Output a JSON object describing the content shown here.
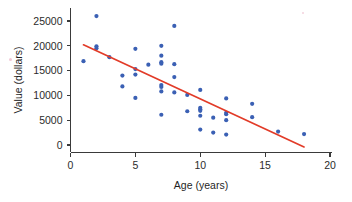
{
  "chart_data": {
    "type": "scatter",
    "title": "",
    "xlabel": "Age (years)",
    "ylabel": "Value (dollars)",
    "xlim": [
      0,
      20
    ],
    "ylim": [
      0,
      27000
    ],
    "xticks": [
      0,
      5,
      10,
      15,
      20
    ],
    "yticks": [
      0,
      5000,
      10000,
      15000,
      20000,
      25000
    ],
    "xtick_labels": [
      "0",
      "5",
      "10",
      "15",
      "20"
    ],
    "ytick_labels": [
      "0",
      "5000",
      "10000",
      "15000",
      "20000",
      "25000"
    ],
    "grid": false,
    "legend": false,
    "point_color": "#3b60b4",
    "line_color": "#e23b28",
    "points": [
      {
        "x": 1,
        "y": 16900
      },
      {
        "x": 2,
        "y": 26000
      },
      {
        "x": 2,
        "y": 19900
      },
      {
        "x": 2,
        "y": 19500
      },
      {
        "x": 3,
        "y": 17700
      },
      {
        "x": 4,
        "y": 14000
      },
      {
        "x": 4,
        "y": 11800
      },
      {
        "x": 5,
        "y": 19400
      },
      {
        "x": 5,
        "y": 15300
      },
      {
        "x": 5,
        "y": 14200
      },
      {
        "x": 5,
        "y": 9500
      },
      {
        "x": 6,
        "y": 16200
      },
      {
        "x": 7,
        "y": 20000
      },
      {
        "x": 7,
        "y": 18000
      },
      {
        "x": 7,
        "y": 16700
      },
      {
        "x": 7,
        "y": 16400
      },
      {
        "x": 7,
        "y": 12100
      },
      {
        "x": 7,
        "y": 11700
      },
      {
        "x": 7,
        "y": 10800
      },
      {
        "x": 7,
        "y": 6100
      },
      {
        "x": 8,
        "y": 24000
      },
      {
        "x": 8,
        "y": 16300
      },
      {
        "x": 8,
        "y": 13700
      },
      {
        "x": 8,
        "y": 10600
      },
      {
        "x": 9,
        "y": 10100
      },
      {
        "x": 9,
        "y": 6800
      },
      {
        "x": 10,
        "y": 11100
      },
      {
        "x": 10,
        "y": 7500
      },
      {
        "x": 10,
        "y": 7200
      },
      {
        "x": 10,
        "y": 6900
      },
      {
        "x": 10,
        "y": 5900
      },
      {
        "x": 10,
        "y": 3100
      },
      {
        "x": 11,
        "y": 5500
      },
      {
        "x": 11,
        "y": 2500
      },
      {
        "x": 12,
        "y": 9400
      },
      {
        "x": 12,
        "y": 6500
      },
      {
        "x": 12,
        "y": 6200
      },
      {
        "x": 12,
        "y": 5000
      },
      {
        "x": 12,
        "y": 2100
      },
      {
        "x": 14,
        "y": 8300
      },
      {
        "x": 14,
        "y": 5600
      },
      {
        "x": 16,
        "y": 2700
      },
      {
        "x": 18,
        "y": 2200
      }
    ],
    "trend_line": {
      "x1": 1.0,
      "y1": 20200,
      "x2": 18.0,
      "y2": -400
    }
  }
}
